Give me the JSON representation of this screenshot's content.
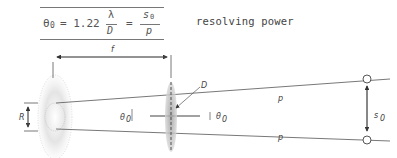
{
  "formula": {
    "theta": "θ",
    "theta_sub": "0",
    "eq1": "= 1.22",
    "frac1_num": "λ",
    "frac1_den": "D",
    "eq2": "=",
    "frac2_num": "s",
    "frac2_num_sub": "0",
    "frac2_den": "p"
  },
  "caption": "resolving power",
  "diagram": {
    "label_f": "f",
    "label_D": "D",
    "label_R": "R",
    "label_theta_left": "θ",
    "label_theta_left_sub": "0",
    "label_theta_right": "θ",
    "label_theta_right_sub": "0",
    "label_p_top": "p",
    "label_p_bottom": "p",
    "label_s": "s",
    "label_s_sub": "0"
  },
  "colors": {
    "line": "#555555",
    "lens": "#bbbbbb",
    "spot": "#cccccc"
  }
}
